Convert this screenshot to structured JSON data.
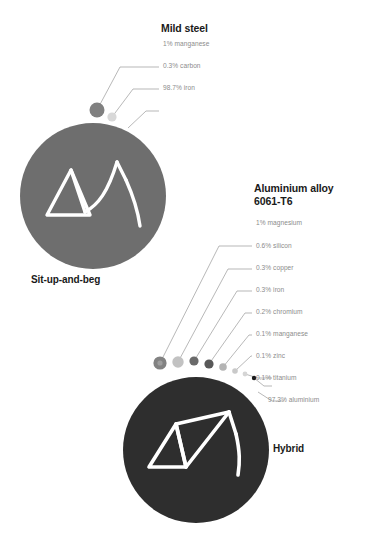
{
  "figure": {
    "background_color": "#ffffff",
    "label_color": "#8c8c8c",
    "title_color": "#1a1a1a",
    "leader_color": "#9a9a9a"
  },
  "groups": [
    {
      "id": "mild-steel",
      "title": "Mild steel",
      "bike_caption": "Sit-up-and-beg",
      "disc_color": "#6e6e6e",
      "frame_color": "#ffffff",
      "disc": {
        "cx": 93,
        "cy": 196,
        "r": 73
      },
      "components": [
        {
          "label": "1% manganese",
          "percent": 1,
          "element": "manganese",
          "dot": {
            "cx": 97,
            "cy": 110,
            "r": 7.5,
            "color": "#808080"
          },
          "label_xy": {
            "x": 163,
            "y": 44
          },
          "leader": "M 97 110 L 120 67 L 159 67"
        },
        {
          "label": "0.3% carbon",
          "percent": 0.3,
          "element": "carbon",
          "dot": {
            "cx": 112,
            "cy": 117,
            "r": 4.6,
            "color": "#d8d8d8"
          },
          "label_xy": {
            "x": 163,
            "y": 66
          },
          "leader": "M 112 117 L 133 89 L 159 89"
        },
        {
          "label": "98.7% iron",
          "percent": 98.7,
          "element": "iron",
          "dot": null,
          "label_xy": {
            "x": 163,
            "y": 88
          },
          "leader": "M 128 128 L 146 111 L 159 111"
        }
      ]
    },
    {
      "id": "aluminium-alloy-6061-t6",
      "title_line1": "Aluminium alloy",
      "title_line2": "6061-T6",
      "bike_caption": "Hybrid",
      "disc_color": "#2e2e2e",
      "frame_color": "#ffffff",
      "disc": {
        "cx": 196,
        "cy": 450,
        "r": 73
      },
      "components": [
        {
          "label": "1% magnesium",
          "percent": 1,
          "element": "magnesium",
          "dot": {
            "cx": 160,
            "cy": 363,
            "r": 6.6,
            "color": "#828282"
          },
          "label_xy": {
            "x": 256,
            "y": 222
          },
          "leader": "M 160 363 L 219 246 L 252 246"
        },
        {
          "label": "0.6% silicon",
          "percent": 0.6,
          "element": "silicon",
          "dot": {
            "cx": 178,
            "cy": 362,
            "r": 5.7,
            "color": "#c2c2c2"
          },
          "label_xy": {
            "x": 256,
            "y": 245
          },
          "leader": "M 178 362 L 228 269 L 252 269"
        },
        {
          "label": "0.3% copper",
          "percent": 0.3,
          "element": "copper",
          "dot": {
            "cx": 194,
            "cy": 361,
            "r": 4.6,
            "color": "#6a6a6a"
          },
          "label_xy": {
            "x": 256,
            "y": 268
          },
          "leader": "M 194 361 L 237 291 L 252 291"
        },
        {
          "label": "0.3% iron",
          "percent": 0.3,
          "element": "iron",
          "dot": {
            "cx": 209,
            "cy": 364,
            "r": 4.6,
            "color": "#585858"
          },
          "label_xy": {
            "x": 256,
            "y": 291
          },
          "leader": "M 209 364 L 245 313 L 252 313"
        },
        {
          "label": "0.2% chromium",
          "percent": 0.2,
          "element": "chromium",
          "dot": {
            "cx": 223,
            "cy": 367,
            "r": 3.8,
            "color": "#b4b4b4"
          },
          "label_xy": {
            "x": 256,
            "y": 313
          },
          "leader": "M 223 367 L 249 335 L 252 335"
        },
        {
          "label": "0.1% manganese",
          "percent": 0.1,
          "element": "manganese",
          "dot": {
            "cx": 235,
            "cy": 371,
            "r": 2.8,
            "color": "#c9c9c9"
          },
          "label_xy": {
            "x": 256,
            "y": 335
          },
          "leader": "M 235 371 L 250 357 L 252 357"
        },
        {
          "label": "0.1% zinc",
          "percent": 0.1,
          "element": "zinc",
          "dot": {
            "cx": 245,
            "cy": 374,
            "r": 2.4,
            "color": "#d5d5d5"
          },
          "label_xy": {
            "x": 256,
            "y": 357
          },
          "leader": "M 245 374 L 253 379 L 260 379 L 272 379"
        },
        {
          "label": "0.1% titanium",
          "percent": 0.1,
          "element": "titanium",
          "dot": {
            "cx": 254,
            "cy": 378,
            "r": 2.2,
            "color": "#1a1a1a"
          },
          "label_xy": {
            "x": 256,
            "y": 379
          },
          "leader": "M 254 378 L 262 386 L 272 386"
        },
        {
          "label": "97.3% aluminium",
          "percent": 97.3,
          "element": "aluminium",
          "dot": null,
          "label_xy": {
            "x": 256,
            "y": 401
          },
          "leader": "M 258 393 L 268 401 L 282 401"
        }
      ]
    }
  ]
}
